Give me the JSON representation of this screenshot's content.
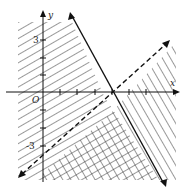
{
  "diagram": {
    "type": "linear-inequality-region",
    "axes": {
      "x_label": "x",
      "y_label": "y",
      "origin_label": "O"
    },
    "tick_labels": {
      "y_pos": "3",
      "y_neg": "-3"
    },
    "lines": [
      {
        "name": "solid-boundary",
        "style": "solid",
        "description": "descending line through upper-left to lower-right"
      },
      {
        "name": "dashed-boundary",
        "style": "dashed",
        "description": "ascending line through lower-left to upper-right, y-intercept -3"
      }
    ],
    "shading": [
      {
        "region": "left of solid line",
        "pattern": "diagonal hatch"
      },
      {
        "region": "below dashed line, right of y-axis",
        "pattern": "diagonal hatch"
      },
      {
        "region": "overlap",
        "pattern": "cross hatch"
      }
    ],
    "colors": {
      "ink": "#222222",
      "background": "#ffffff"
    }
  }
}
